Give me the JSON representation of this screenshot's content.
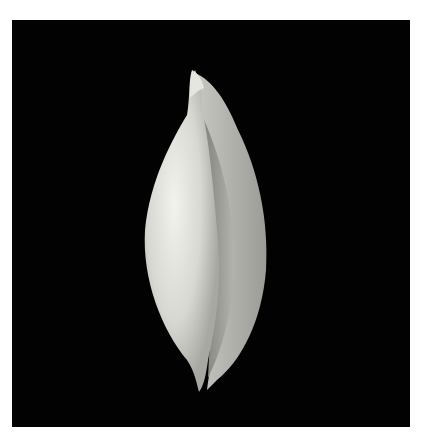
{
  "image": {
    "subject": "white gastropod shell (aperture view) on black background",
    "background_color": "#020202",
    "frame_color": "#ffffff",
    "shell_color": "#dcdcd6",
    "aperture_color": "#9a9a95"
  }
}
